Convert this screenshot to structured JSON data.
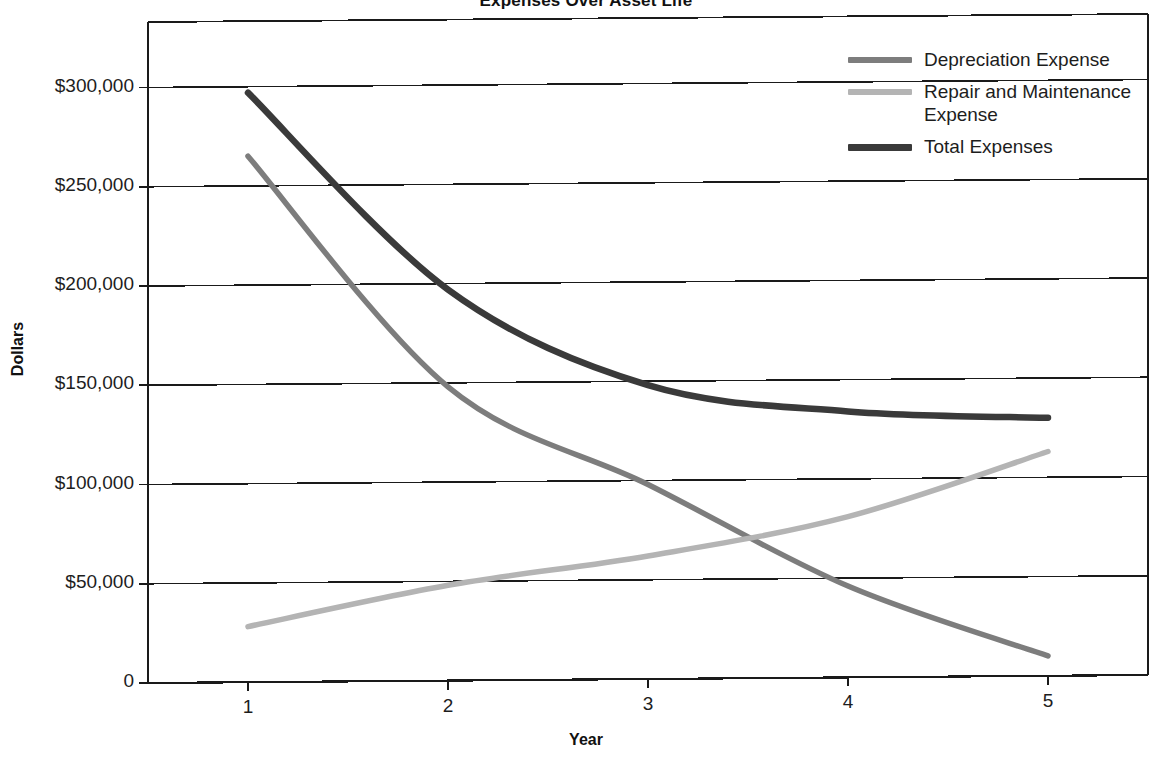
{
  "chart_data": {
    "type": "line",
    "title": "Expenses Over Asset Life",
    "xlabel": "Year",
    "ylabel": "Dollars",
    "x": [
      1,
      2,
      3,
      4,
      5
    ],
    "categories": [
      "1",
      "2",
      "3",
      "4",
      "5"
    ],
    "xtick_labels": [
      "1",
      "2",
      "3",
      "4",
      "5"
    ],
    "ytick_labels": [
      "0",
      "$50,000",
      "$100,000",
      "$150,000",
      "$200,000",
      "$250,000",
      "$300,000"
    ],
    "ytick_values": [
      0,
      50000,
      100000,
      150000,
      200000,
      250000,
      300000
    ],
    "ylim": [
      0,
      333000
    ],
    "xlim": [
      0.5,
      5.5
    ],
    "grid": "horizontal",
    "legend_position": "top-right",
    "series": [
      {
        "name": "Depreciation Expense",
        "color": "#7d7d7d",
        "values": [
          265000,
          148000,
          98000,
          46000,
          10000
        ]
      },
      {
        "name": "Repair and Maintenance Expense",
        "color": "#b4b4b4",
        "values": [
          28000,
          48000,
          62000,
          81000,
          113000
        ]
      },
      {
        "name": "Total Expenses",
        "color": "#3a3a3a",
        "values": [
          297000,
          197000,
          148000,
          134000,
          130000
        ]
      }
    ]
  },
  "legend": {
    "entries": [
      {
        "label": "Depreciation Expense",
        "color": "#7d7d7d"
      },
      {
        "label": "Repair and Maintenance Expense",
        "color": "#b4b4b4"
      },
      {
        "label": "Total Expenses",
        "color": "#3a3a3a"
      }
    ]
  },
  "axes": {
    "x_title": "Year",
    "y_title": "Dollars"
  },
  "colors": {
    "frame": "#1a1a1a",
    "gridline": "#1a1a1a",
    "background": "#ffffff",
    "text": "#1d1d1d"
  }
}
